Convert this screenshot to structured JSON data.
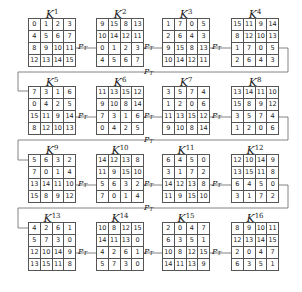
{
  "diagram": {
    "operator_label": "P",
    "operator_subscript": "T",
    "matrices": [
      {
        "name": "K",
        "index": "1",
        "cells": [
          [
            0,
            1,
            2,
            3
          ],
          [
            4,
            5,
            6,
            7
          ],
          [
            8,
            9,
            10,
            11
          ],
          [
            12,
            13,
            14,
            15
          ]
        ]
      },
      {
        "name": "K",
        "index": "2",
        "cells": [
          [
            9,
            15,
            8,
            13
          ],
          [
            10,
            14,
            12,
            11
          ],
          [
            0,
            1,
            2,
            3
          ],
          [
            4,
            5,
            6,
            7
          ]
        ]
      },
      {
        "name": "K",
        "index": "3",
        "cells": [
          [
            1,
            7,
            0,
            5
          ],
          [
            2,
            6,
            4,
            3
          ],
          [
            9,
            15,
            8,
            13
          ],
          [
            10,
            14,
            12,
            11
          ]
        ]
      },
      {
        "name": "K",
        "index": "4",
        "cells": [
          [
            15,
            11,
            9,
            14
          ],
          [
            8,
            12,
            10,
            13
          ],
          [
            1,
            7,
            0,
            5
          ],
          [
            2,
            6,
            4,
            3
          ]
        ]
      },
      {
        "name": "K",
        "index": "5",
        "cells": [
          [
            7,
            3,
            1,
            6
          ],
          [
            0,
            4,
            2,
            5
          ],
          [
            15,
            11,
            9,
            14
          ],
          [
            8,
            12,
            10,
            13
          ]
        ]
      },
      {
        "name": "K",
        "index": "6",
        "cells": [
          [
            11,
            13,
            15,
            12
          ],
          [
            9,
            10,
            8,
            14
          ],
          [
            7,
            3,
            1,
            6
          ],
          [
            0,
            4,
            2,
            5
          ]
        ]
      },
      {
        "name": "K",
        "index": "7",
        "cells": [
          [
            3,
            5,
            7,
            4
          ],
          [
            1,
            2,
            0,
            6
          ],
          [
            11,
            13,
            15,
            12
          ],
          [
            9,
            10,
            8,
            14
          ]
        ]
      },
      {
        "name": "K",
        "index": "8",
        "cells": [
          [
            13,
            14,
            11,
            10
          ],
          [
            15,
            8,
            9,
            12
          ],
          [
            3,
            5,
            7,
            4
          ],
          [
            1,
            2,
            0,
            6
          ]
        ]
      },
      {
        "name": "K",
        "index": "9",
        "cells": [
          [
            5,
            6,
            3,
            2
          ],
          [
            7,
            0,
            1,
            4
          ],
          [
            13,
            14,
            11,
            10
          ],
          [
            15,
            8,
            9,
            12
          ]
        ]
      },
      {
        "name": "K",
        "index": "10",
        "cells": [
          [
            14,
            12,
            13,
            8
          ],
          [
            11,
            9,
            15,
            10
          ],
          [
            5,
            6,
            3,
            2
          ],
          [
            7,
            0,
            1,
            4
          ]
        ]
      },
      {
        "name": "K",
        "index": "11",
        "cells": [
          [
            6,
            4,
            5,
            0
          ],
          [
            3,
            1,
            7,
            2
          ],
          [
            14,
            12,
            13,
            8
          ],
          [
            11,
            9,
            15,
            10
          ]
        ]
      },
      {
        "name": "K",
        "index": "12",
        "cells": [
          [
            12,
            10,
            14,
            9
          ],
          [
            13,
            15,
            11,
            8
          ],
          [
            6,
            4,
            5,
            0
          ],
          [
            3,
            1,
            7,
            2
          ]
        ]
      },
      {
        "name": "K",
        "index": "13",
        "cells": [
          [
            4,
            2,
            6,
            1
          ],
          [
            5,
            7,
            3,
            0
          ],
          [
            12,
            10,
            14,
            9
          ],
          [
            13,
            15,
            11,
            8
          ]
        ]
      },
      {
        "name": "K",
        "index": "14",
        "cells": [
          [
            10,
            8,
            12,
            15
          ],
          [
            14,
            11,
            13,
            0
          ],
          [
            4,
            2,
            6,
            1
          ],
          [
            5,
            7,
            3,
            0
          ]
        ]
      },
      {
        "name": "K",
        "index": "15",
        "cells": [
          [
            2,
            0,
            4,
            7
          ],
          [
            6,
            3,
            5,
            1
          ],
          [
            10,
            8,
            12,
            15
          ],
          [
            14,
            11,
            13,
            9
          ]
        ]
      },
      {
        "name": "K",
        "index": "16",
        "cells": [
          [
            8,
            9,
            10,
            11
          ],
          [
            12,
            13,
            14,
            15
          ],
          [
            2,
            0,
            4,
            7
          ],
          [
            6,
            3,
            5,
            1
          ]
        ]
      }
    ]
  }
}
